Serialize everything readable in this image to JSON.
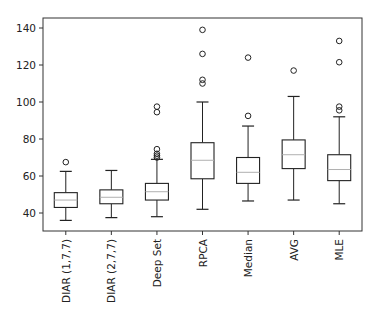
{
  "chart_data": {
    "type": "box",
    "title": "",
    "xlabel": "",
    "ylabel": "",
    "ylim": [
      30,
      145
    ],
    "yticks": [
      40,
      60,
      80,
      100,
      120,
      140
    ],
    "grid": false,
    "legend": null,
    "categories": [
      "DIAR (1,7,7)",
      "DIAR (2,7,7)",
      "Deep Set",
      "RPCA",
      "Median",
      "AVG",
      "MLE"
    ],
    "series": [
      {
        "name": "DIAR (1,7,7)",
        "whisker_low": 36,
        "q1": 43,
        "median": 47,
        "q3": 51,
        "whisker_high": 62.5,
        "outliers": [
          67.5
        ]
      },
      {
        "name": "DIAR (2,7,7)",
        "whisker_low": 37.5,
        "q1": 45,
        "median": 48.5,
        "q3": 52.5,
        "whisker_high": 63,
        "outliers": []
      },
      {
        "name": "Deep Set",
        "whisker_low": 38,
        "q1": 47,
        "median": 51.5,
        "q3": 56,
        "whisker_high": 69,
        "outliers": [
          70,
          71,
          72,
          74.5,
          94.5,
          97.5
        ]
      },
      {
        "name": "RPCA",
        "whisker_low": 42,
        "q1": 58.5,
        "median": 68.5,
        "q3": 78,
        "whisker_high": 100,
        "outliers": [
          110,
          112,
          126,
          139
        ]
      },
      {
        "name": "Median",
        "whisker_low": 46.5,
        "q1": 56,
        "median": 62,
        "q3": 70,
        "whisker_high": 87,
        "outliers": [
          92.5,
          124
        ]
      },
      {
        "name": "AVG",
        "whisker_low": 47,
        "q1": 64,
        "median": 71.5,
        "q3": 79.5,
        "whisker_high": 103,
        "outliers": [
          117
        ]
      },
      {
        "name": "MLE",
        "whisker_low": 45,
        "q1": 57.5,
        "median": 63.5,
        "q3": 71.5,
        "whisker_high": 92,
        "outliers": [
          95.5,
          97.5,
          121.5,
          133
        ]
      }
    ]
  },
  "colors": {
    "box": "#222222",
    "median": "#b0b0b0",
    "axis": "#333333",
    "outlier": "#222222"
  }
}
